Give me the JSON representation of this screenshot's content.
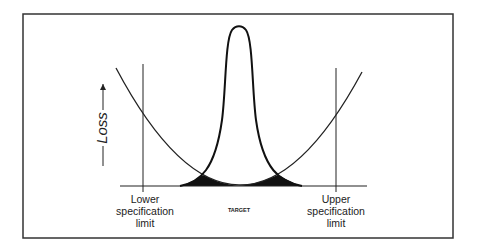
{
  "diagram": {
    "y_axis_label": "Loss",
    "labels": {
      "lower_spec": [
        "Lower",
        "specification",
        "limit"
      ],
      "upper_spec": [
        "Upper",
        "specification",
        "limit"
      ],
      "target": "TARGET"
    },
    "colors": {
      "stroke": "#1a1a1a",
      "fill": "#111111",
      "background": "#ffffff"
    }
  }
}
